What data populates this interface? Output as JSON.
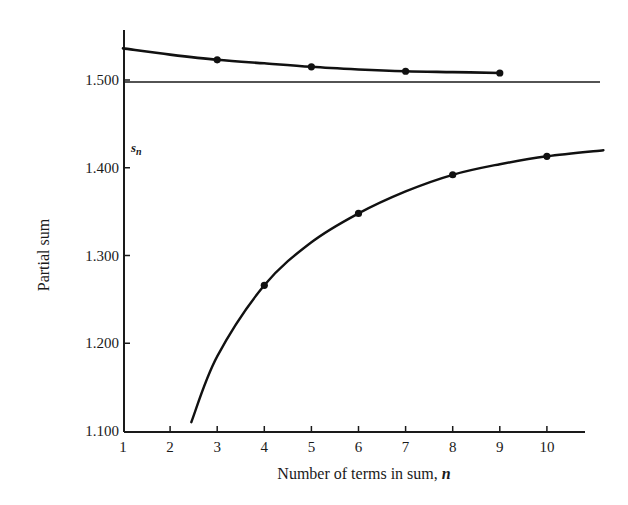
{
  "chart_data": {
    "type": "line",
    "title": "",
    "xlabel": "Number of terms in sum, ",
    "xlabel_var": "n",
    "ylabel": "Partial sum",
    "xlim": [
      1,
      11.3
    ],
    "ylim": [
      1.1,
      1.55
    ],
    "x_ticks": [
      1,
      2,
      3,
      4,
      5,
      6,
      7,
      8,
      9,
      10
    ],
    "x_tick_labels": [
      "1",
      "2",
      "3",
      "4",
      "5",
      "6",
      "7",
      "8",
      "9",
      "10"
    ],
    "y_ticks": [
      1.1,
      1.2,
      1.3,
      1.4,
      1.5
    ],
    "y_tick_labels": [
      "1.100",
      "1.200",
      "1.300",
      "1.400",
      "1.500"
    ],
    "grid": false,
    "annotations": [
      {
        "text": "s",
        "subscript": "n",
        "near": "y-axis, just above 1.400"
      }
    ],
    "reference_lines": [
      {
        "name": "limit",
        "y": 1.5,
        "x_range": [
          1,
          11.3
        ]
      }
    ],
    "series": [
      {
        "name": "upper partial sums (odd n)",
        "curve": {
          "x": [
            1,
            2,
            3,
            4,
            5,
            6,
            7,
            8,
            9
          ],
          "y": [
            1.536,
            1.529,
            1.523,
            1.519,
            1.515,
            1.512,
            1.51,
            1.509,
            1.508
          ]
        },
        "points": {
          "x": [
            3,
            5,
            7,
            9
          ],
          "y": [
            1.523,
            1.515,
            1.51,
            1.508
          ]
        }
      },
      {
        "name": "lower partial sums (even n)",
        "curve": {
          "x": [
            2.45,
            3,
            4,
            5,
            6,
            7,
            8,
            9,
            10,
            11.2
          ],
          "y": [
            1.11,
            1.185,
            1.266,
            1.315,
            1.348,
            1.373,
            1.392,
            1.404,
            1.413,
            1.42
          ]
        },
        "points": {
          "x": [
            4,
            6,
            8,
            10
          ],
          "y": [
            1.266,
            1.348,
            1.392,
            1.413
          ]
        }
      }
    ]
  }
}
